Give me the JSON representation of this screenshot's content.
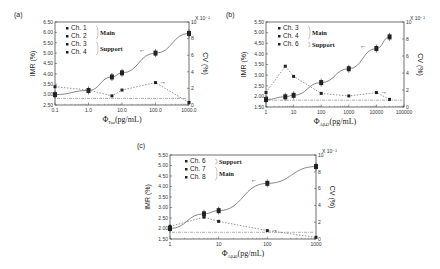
{
  "chart_data": [
    {
      "panel": "(a)",
      "type": "line",
      "xlabel": "Φ_Tau(pg/mL)",
      "xlabel_main": "Φ",
      "xlabel_sub": "Tau",
      "xlabel_unit": "(pg/mL)",
      "ylabel": "IMR (%)",
      "y2label": "CV (%)",
      "y2_multiplier": "X 10⁻²",
      "xscale": "log",
      "xlim": [
        0.1,
        1000
      ],
      "xticks": [
        "0.1",
        "1.0",
        "10.0",
        "100.0",
        "1000.0"
      ],
      "xtick_values": [
        0.1,
        1,
        10,
        100,
        1000
      ],
      "ylim": [
        2.5,
        6.5
      ],
      "yticks": [
        "2.50",
        "3.00",
        "3.50",
        "4.00",
        "4.50",
        "5.00",
        "5.50",
        "6.00",
        "6.50"
      ],
      "y2lim": [
        0,
        10
      ],
      "y2ticks": [
        "0",
        "2",
        "4",
        "6",
        "8",
        "10"
      ],
      "legend": [
        {
          "label": "Ch. 1",
          "group": "Main"
        },
        {
          "label": "Ch. 2",
          "group": "Main"
        },
        {
          "label": "Ch. 3",
          "group": "Support"
        },
        {
          "label": "Ch. 4",
          "group": "Support"
        }
      ],
      "legend_groups": [
        "Main",
        "Support"
      ],
      "series": [
        {
          "name": "IMR",
          "axis": "left",
          "x": [
            0.1,
            1,
            5,
            10,
            100,
            1000
          ],
          "values": [
            3.0,
            3.2,
            3.85,
            4.05,
            5.0,
            5.95
          ]
        },
        {
          "name": "CV",
          "axis": "right",
          "x": [
            0.1,
            1,
            5,
            10,
            100,
            1000
          ],
          "values": [
            2.2,
            1.8,
            1.1,
            1.8,
            2.7,
            0.3
          ]
        }
      ],
      "annotations": [
        "←",
        "→"
      ]
    },
    {
      "panel": "(b)",
      "type": "line",
      "xlabel": "Φ_Aβ42(pg/mL)",
      "xlabel_main": "Φ",
      "xlabel_sub": "Aβ42",
      "xlabel_unit": "(pg/mL)",
      "ylabel": "IMR (%)",
      "y2label": "CV (%)",
      "y2_multiplier": "X 10⁻²",
      "xscale": "log",
      "xlim": [
        1,
        100000
      ],
      "xticks": [
        "1",
        "10",
        "100",
        "1000",
        "10000",
        "100000"
      ],
      "xtick_values": [
        1,
        10,
        100,
        1000,
        10000,
        100000
      ],
      "ylim": [
        1.5,
        5.5
      ],
      "yticks": [
        "1.50",
        "2.00",
        "2.50",
        "3.00",
        "3.50",
        "4.00",
        "4.50",
        "5.00",
        "5.50"
      ],
      "y2lim": [
        0,
        10
      ],
      "y2ticks": [
        "0",
        "2",
        "4",
        "6",
        "8",
        "10"
      ],
      "legend": [
        {
          "label": "Ch. 3",
          "group": "Main"
        },
        {
          "label": "Ch. 4",
          "group": "Main"
        },
        {
          "label": "Ch. 6",
          "group": "Support"
        }
      ],
      "legend_groups": [
        "Main",
        "Support"
      ],
      "series": [
        {
          "name": "IMR",
          "axis": "left",
          "x": [
            1,
            5,
            10,
            100,
            1000,
            10000,
            30000
          ],
          "values": [
            1.85,
            1.98,
            2.05,
            2.65,
            3.3,
            4.25,
            4.8
          ]
        },
        {
          "name": "CV",
          "axis": "right",
          "x": [
            1,
            5,
            10,
            100,
            1000,
            10000,
            30000
          ],
          "values": [
            1.7,
            4.8,
            3.6,
            1.6,
            1.3,
            1.7,
            0.9
          ]
        }
      ],
      "annotations": [
        "←",
        "→"
      ]
    },
    {
      "panel": "(c)",
      "type": "line",
      "xlabel": "Φ_Aβ40(pg/mL)",
      "xlabel_main": "Φ",
      "xlabel_sub": "Aβ40",
      "xlabel_unit": "(pg/mL)",
      "ylabel": "IMR (%)",
      "y2label": "CV (%)",
      "y2_multiplier": "X 10⁻²",
      "xscale": "log",
      "xlim": [
        1,
        1000
      ],
      "xticks": [
        "1",
        "10",
        "100",
        "1000"
      ],
      "xtick_values": [
        1,
        10,
        100,
        1000
      ],
      "ylim": [
        1.5,
        5.5
      ],
      "yticks": [
        "1.50",
        "2.00",
        "2.50",
        "3.00",
        "3.50",
        "4.00",
        "4.50",
        "5.00",
        "5.50"
      ],
      "y2lim": [
        0,
        10
      ],
      "y2ticks": [
        "0",
        "2",
        "4",
        "6",
        "8",
        "10"
      ],
      "legend": [
        {
          "label": "Ch. 6",
          "group": "Support"
        },
        {
          "label": "Ch. 7",
          "group": "Main"
        },
        {
          "label": "Ch. 8",
          "group": "Main"
        }
      ],
      "legend_groups": [
        "Support",
        "Main"
      ],
      "series": [
        {
          "name": "IMR",
          "axis": "left",
          "x": [
            1,
            5,
            10,
            100,
            1000
          ],
          "values": [
            2.0,
            2.7,
            2.85,
            4.15,
            4.95
          ]
        },
        {
          "name": "CV",
          "axis": "right",
          "x": [
            1,
            5,
            10,
            100,
            1000
          ],
          "values": [
            1.5,
            2.6,
            2.1,
            1.0,
            0.2
          ]
        }
      ],
      "annotations": [
        "←",
        "→"
      ]
    }
  ],
  "panels": [
    {
      "label": "(a)"
    },
    {
      "label": "(b)"
    },
    {
      "label": "(c)"
    }
  ]
}
